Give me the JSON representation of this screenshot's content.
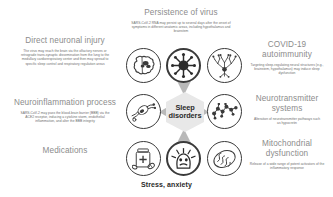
{
  "figure": {
    "center_label": "Sleep\ndisorders",
    "bottom_label": "Stress, anxiety"
  },
  "left_column": [
    {
      "id": "direct-neuronal-injury",
      "heading": "Direct neuronal injury",
      "body": "The virus may reach the brain via the olfactory nerves or retrograde trans-synaptic dissemination from the lung to the medullary cardiorespiratory center and then may spread to specific sleep control and respiratory regulation areas"
    },
    {
      "id": "neuroinflammation-process",
      "heading": "Neuroinflammation process",
      "body": "SARS-CoV-2 may pass the blood-brain barrier (BBB) via the ACE2 receptor, inducing a cytokine storm, endothelial inflammation, and alter the BBB integrity"
    },
    {
      "id": "medications",
      "heading": "Medications",
      "body": ""
    }
  ],
  "top_center": {
    "id": "persistence-of-virus",
    "heading": "Persistence of virus",
    "body": "SARS-CoV-2 RNA may persist up to several days after the onset of symptoms in different anatomic areas, including hypothalamus and brainstem"
  },
  "right_column": [
    {
      "id": "covid-19-autoimmunity",
      "heading": "COVID-19\nautoimmunity",
      "body": "Targeting sleep-regulating neural structures (e.g., brainstem, hypothalamus) may induce sleep dysfunction"
    },
    {
      "id": "neurotransmitter-systems",
      "heading": "Neurotransmitter\nsystems",
      "body": "Alteration of neurotransmitter pathways such as hypocretin"
    },
    {
      "id": "mitochondrial-dysfunction",
      "heading": "Mitochondrial\ndysfunction",
      "body": "Release of a wide range of potent activators of the inflammatory response"
    }
  ],
  "icons": [
    {
      "name": "brain-icon",
      "row": 0,
      "col": 0,
      "dark": false
    },
    {
      "name": "virus-icon",
      "row": 0,
      "col": 1,
      "dark": true
    },
    {
      "name": "neuron-antibody-icon",
      "row": 0,
      "col": 2,
      "dark": false
    },
    {
      "name": "synapse-icon",
      "row": 1,
      "col": 0,
      "dark": false
    },
    {
      "name": "molecule-icon",
      "row": 1,
      "col": 2,
      "dark": false
    },
    {
      "name": "pill-bottle-icon",
      "row": 2,
      "col": 0,
      "dark": false
    },
    {
      "name": "stressed-head-icon",
      "row": 2,
      "col": 1,
      "dark": true
    },
    {
      "name": "mitochondrion-icon",
      "row": 2,
      "col": 2,
      "dark": false
    }
  ],
  "colors": {
    "heading": "#8c8c8c",
    "body": "#6d6d6d",
    "stroke": "#3a3a3a",
    "hex_fill": "#e8e8e8",
    "wedge": "#b9b9b9"
  }
}
